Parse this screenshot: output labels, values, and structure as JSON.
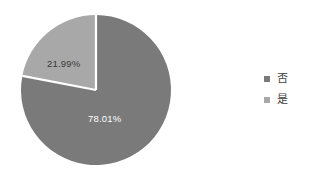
{
  "chart_data": {
    "type": "pie",
    "title": "",
    "categories": [
      "否",
      "是"
    ],
    "values": [
      78.01,
      21.99
    ],
    "labels": [
      "78.01%",
      "21.99%"
    ],
    "units": "percent",
    "start_angle_deg": 0,
    "direction": "counterclockwise",
    "legend_position": "right",
    "grid": false,
    "series": [
      {
        "name": "否",
        "value": 78.01,
        "label": "78.01%",
        "color": "#7a7a7a",
        "label_color": "#ffffff"
      },
      {
        "name": "是",
        "value": 21.99,
        "label": "21.99%",
        "color": "#a8a8a8",
        "label_color": "#3a3a3a"
      }
    ]
  },
  "legend": {
    "items": [
      {
        "label": "否",
        "color": "#7a7a7a"
      },
      {
        "label": "是",
        "color": "#a8a8a8"
      }
    ]
  },
  "colors": {
    "background": "#ffffff",
    "slice_major": "#7a7a7a",
    "slice_minor": "#a8a8a8",
    "separator": "#ffffff"
  }
}
